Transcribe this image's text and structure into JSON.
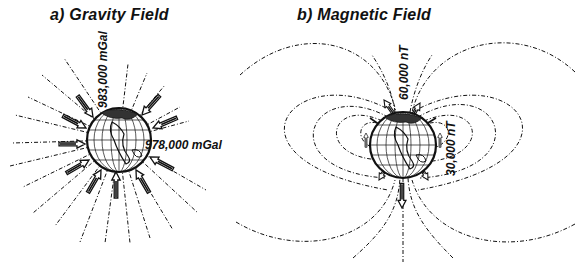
{
  "panels": {
    "gravity": {
      "title": "a) Gravity Field",
      "labels": {
        "polar": "983,000 mGal",
        "equatorial": "978,000 mGal"
      }
    },
    "magnetic": {
      "title": "b) Magnetic Field",
      "labels": {
        "polar": "60,000 nT",
        "equatorial": "30,000 nT"
      }
    }
  },
  "colors": {
    "ink": "#111111",
    "background": "#ffffff"
  }
}
